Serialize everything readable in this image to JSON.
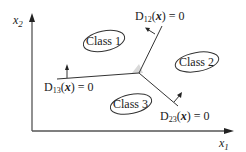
{
  "diagram": {
    "type": "decision-boundaries",
    "axes": {
      "x_label": "x",
      "x_sub": "1",
      "y_label": "x",
      "y_sub": "2"
    },
    "classes": [
      {
        "label": "Class 1"
      },
      {
        "label": "Class 2"
      },
      {
        "label": "Class 3"
      }
    ],
    "boundaries": [
      {
        "name": "D",
        "sub": "12",
        "arg": "x",
        "rhs": "= 0"
      },
      {
        "name": "D",
        "sub": "13",
        "arg": "x",
        "rhs": "= 0"
      },
      {
        "name": "D",
        "sub": "23",
        "arg": "x",
        "rhs": "= 0"
      }
    ],
    "colors": {
      "line": "#333333",
      "axis": "#555555",
      "junction_fill": "#d9d9d9",
      "text": "#222222"
    }
  }
}
